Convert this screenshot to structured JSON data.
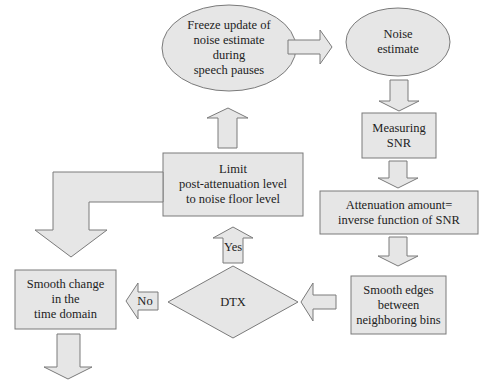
{
  "diagram": {
    "type": "flowchart",
    "nodes": {
      "freeze": "Freeze update of\nnoise estimate\nduring\nspeech pauses",
      "noise_estimate": "Noise\nestimate",
      "measuring_snr": "Measuring\nSNR",
      "attenuation": "Attenuation amount=\ninverse function of  SNR",
      "smooth_edges": "Smooth edges\nbetween\nneighboring bins",
      "dtx": "DTX",
      "limit": "Limit\npost-attenuation level\nto noise floor level",
      "smooth_time": "Smooth change\nin the\ntime domain"
    },
    "edges": {
      "yes_label": "Yes",
      "no_label": "No"
    },
    "colors": {
      "fill": "#e6e6e6",
      "stroke": "#7a7a7a"
    }
  }
}
